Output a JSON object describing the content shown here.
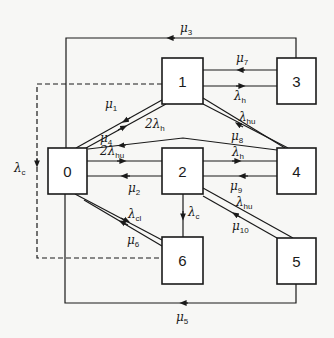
{
  "diagram": {
    "type": "state-transition",
    "colors": {
      "line": "#1a1a1a",
      "background": "#f7f7f5",
      "box": "#ffffff"
    },
    "nodes": [
      {
        "id": "0",
        "label": "0"
      },
      {
        "id": "1",
        "label": "1"
      },
      {
        "id": "2",
        "label": "2"
      },
      {
        "id": "3",
        "label": "3"
      },
      {
        "id": "4",
        "label": "4"
      },
      {
        "id": "5",
        "label": "5"
      },
      {
        "id": "6",
        "label": "6"
      }
    ],
    "edges": [
      {
        "from": "3",
        "to": "0",
        "label": "μ",
        "sub": "3"
      },
      {
        "from": "3",
        "to": "1",
        "label": "μ",
        "sub": "7"
      },
      {
        "from": "1",
        "to": "3",
        "label": "λ",
        "sub": "h"
      },
      {
        "from": "1",
        "to": "0",
        "label": "μ",
        "sub": "1"
      },
      {
        "from": "0",
        "to": "1",
        "label": "2λ",
        "sub": "h"
      },
      {
        "from": "4",
        "to": "0",
        "label": "μ",
        "sub": "4"
      },
      {
        "from": "0",
        "to": "2",
        "label": "2λ",
        "sub": "hu"
      },
      {
        "from": "2",
        "to": "0",
        "label": "μ",
        "sub": "2"
      },
      {
        "from": "1",
        "to": "4",
        "label": "λ",
        "sub": "hu"
      },
      {
        "from": "4",
        "to": "1",
        "label": "μ",
        "sub": "8"
      },
      {
        "from": "2",
        "to": "4",
        "label": "λ",
        "sub": "h"
      },
      {
        "from": "4",
        "to": "2",
        "label": "μ",
        "sub": "9"
      },
      {
        "from": "2",
        "to": "5",
        "label": "λ",
        "sub": "hu"
      },
      {
        "from": "5",
        "to": "2",
        "label": "μ",
        "sub": "10"
      },
      {
        "from": "2",
        "to": "6",
        "label": "λ",
        "sub": "c"
      },
      {
        "from": "0",
        "to": "6",
        "label": "λ",
        "sub": "cl"
      },
      {
        "from": "6",
        "to": "0",
        "label": "μ",
        "sub": "6"
      },
      {
        "from": "5",
        "to": "0",
        "label": "μ",
        "sub": "5"
      },
      {
        "from": "1/6",
        "to": "0",
        "label": "λ",
        "sub": "c",
        "style": "dashed"
      }
    ]
  }
}
